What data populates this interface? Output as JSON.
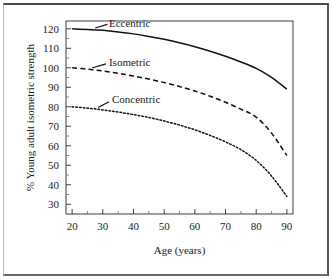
{
  "chart_data": {
    "type": "line",
    "title": "",
    "xlabel": "Age (years)",
    "ylabel": "% Young adult isometric strength",
    "xlim": [
      18,
      92
    ],
    "ylim": [
      25,
      124
    ],
    "x_ticks": [
      20,
      30,
      40,
      50,
      60,
      70,
      80,
      90
    ],
    "y_ticks": [
      30,
      40,
      50,
      60,
      70,
      80,
      90,
      100,
      110,
      120
    ],
    "x_minor_ticks": [
      25,
      35,
      45,
      55,
      65,
      75,
      85
    ],
    "y_minor_ticks": [
      35,
      45,
      55,
      65,
      75,
      85,
      95,
      105,
      115
    ],
    "grid": false,
    "legend_position": "inline-curve-labels",
    "x": [
      20,
      25,
      30,
      35,
      40,
      45,
      50,
      55,
      60,
      65,
      70,
      75,
      80,
      85,
      90
    ],
    "series": [
      {
        "name": "Eccentric",
        "style": "solid",
        "color": "#111111",
        "label_x": 32,
        "label_y": 123,
        "values": [
          120.0,
          119.7,
          119.2,
          118.4,
          117.4,
          116.1,
          114.6,
          112.8,
          110.8,
          108.5,
          105.9,
          103.0,
          99.7,
          95.1,
          89.0
        ]
      },
      {
        "name": "Isometric",
        "style": "dashed",
        "color": "#111111",
        "label_x": 32,
        "label_y": 103,
        "values": [
          100.0,
          99.3,
          98.4,
          97.2,
          95.8,
          94.2,
          92.4,
          90.4,
          88.1,
          85.4,
          82.3,
          78.8,
          74.7,
          66.5,
          55.0
        ]
      },
      {
        "name": "Concentric",
        "style": "dotted",
        "color": "#111111",
        "label_x": 33,
        "label_y": 84,
        "values": [
          80.0,
          79.3,
          78.4,
          77.3,
          76.0,
          74.5,
          72.7,
          70.6,
          68.2,
          65.3,
          62.0,
          58.0,
          52.5,
          44.5,
          34.0
        ]
      }
    ]
  },
  "axes": {
    "x_title": "Age (years)",
    "y_title": "% Young adult isometric strength"
  },
  "x_tick_labels": [
    "20",
    "30",
    "40",
    "50",
    "60",
    "70",
    "80",
    "90"
  ],
  "y_tick_labels": [
    "30",
    "40",
    "50",
    "60",
    "70",
    "80",
    "90",
    "100",
    "110",
    "120"
  ],
  "curve_labels": [
    "Eccentric",
    "Isometric",
    "Concentric"
  ]
}
